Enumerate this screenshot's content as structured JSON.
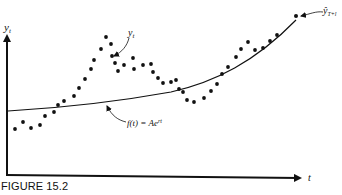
{
  "figure": {
    "caption": "FIGURE 15.2",
    "y_axis_label": "y",
    "y_axis_subscript": "t",
    "x_axis_label": "t",
    "data_label": "y",
    "data_label_subscript": "t",
    "curve_label": "f(t) = Ae",
    "curve_label_superscript": "rt",
    "forecast_label": "ŷ",
    "forecast_label_subscript": "T+l",
    "colors": {
      "ink": "#111111",
      "background": "#ffffff"
    }
  },
  "chart_data": {
    "type": "scatter",
    "title": "FIGURE 15.2",
    "xlabel": "t",
    "ylabel": "y_t",
    "grid": false,
    "legend": "none (inline annotations)",
    "annotations": [
      "y_t (observed points)",
      "f(t) = Ae^{rt} (fitted exponential trend)",
      "ŷ_{T+l} (forecast point)"
    ],
    "series": [
      {
        "name": "y_t",
        "kind": "scatter",
        "points_px": [
          [
            15,
            129
          ],
          [
            23,
            122
          ],
          [
            31,
            128
          ],
          [
            40,
            125
          ],
          [
            45,
            116
          ],
          [
            54,
            112
          ],
          [
            58,
            105
          ],
          [
            64,
            101
          ],
          [
            74,
            96
          ],
          [
            79,
            88
          ],
          [
            85,
            79
          ],
          [
            91,
            69
          ],
          [
            94,
            60
          ],
          [
            101,
            49
          ],
          [
            106,
            37
          ],
          [
            111,
            44
          ],
          [
            112,
            56
          ],
          [
            115,
            63
          ],
          [
            118,
            71
          ],
          [
            124,
            65
          ],
          [
            133,
            58
          ],
          [
            134,
            69
          ],
          [
            143,
            65
          ],
          [
            151,
            64
          ],
          [
            153,
            72
          ],
          [
            158,
            78
          ],
          [
            163,
            83
          ],
          [
            171,
            82
          ],
          [
            176,
            80
          ],
          [
            179,
            89
          ],
          [
            183,
            92
          ],
          [
            187,
            100
          ],
          [
            194,
            102
          ],
          [
            204,
            98
          ],
          [
            211,
            91
          ],
          [
            217,
            84
          ],
          [
            222,
            74
          ],
          [
            228,
            67
          ],
          [
            236,
            57
          ],
          [
            241,
            49
          ],
          [
            248,
            42
          ],
          [
            255,
            50
          ],
          [
            263,
            48
          ],
          [
            270,
            41
          ],
          [
            277,
            35
          ]
        ]
      },
      {
        "name": "f(t) = Ae^{rt}",
        "kind": "line",
        "points_px": [
          [
            8,
            111
          ],
          [
            50,
            108
          ],
          [
            100,
            103
          ],
          [
            140,
            98
          ],
          [
            171,
            92
          ],
          [
            200,
            85
          ],
          [
            230,
            73
          ],
          [
            260,
            55
          ],
          [
            280,
            40
          ],
          [
            296,
            20
          ]
        ]
      },
      {
        "name": "ŷ_{T+l}",
        "kind": "point",
        "points_px": [
          [
            296,
            16
          ]
        ]
      }
    ]
  }
}
